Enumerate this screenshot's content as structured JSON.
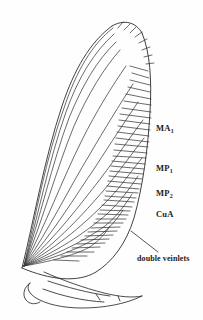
{
  "figure": {
    "domain": "scientific-illustration",
    "background_color": "#fefefe",
    "line_color": "#2b2b2b",
    "text_color": "#1a1a1a"
  },
  "labels": {
    "ma1": {
      "base": "MA",
      "subscript": "1",
      "full": "MA1"
    },
    "mp1": {
      "base": "MP",
      "subscript": "1",
      "full": "MP1"
    },
    "mp2": {
      "base": "MP",
      "subscript": "2",
      "full": "MP2"
    },
    "cua": {
      "base": "CuA",
      "subscript": "",
      "full": "CuA"
    },
    "double_veinlets": {
      "text": "double veinlets"
    }
  },
  "annotations": [
    {
      "name": "leader-line",
      "from": "double veinlets label",
      "to": "posterior wing margin veinlets"
    }
  ],
  "drawing_elements": {
    "wing_outline": "elongate costal margin with rounded apex and broad posterior margin",
    "longitudinal_veins": 14,
    "marginal_veinlets": 46,
    "anal_lobe": "separate basal lobe below main wing"
  }
}
